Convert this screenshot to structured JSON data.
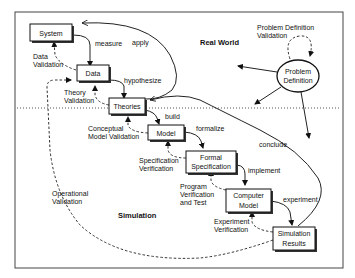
{
  "regions": {
    "real_world": "Real World",
    "simulation": "Simulation"
  },
  "nodes": {
    "system": [
      "System"
    ],
    "data": [
      "Data"
    ],
    "theories": [
      "Theories"
    ],
    "model": [
      "Model"
    ],
    "formal_spec": [
      "Formal",
      "Specification"
    ],
    "computer_model": [
      "Computer",
      "Model"
    ],
    "sim_results": [
      "Simulation",
      "Results"
    ],
    "problem_def": [
      "Problem",
      "Definition"
    ]
  },
  "edges": {
    "measure": "measure",
    "apply": "apply",
    "hypothesize": "hypothesize",
    "build": "build",
    "formalize": "formalize",
    "implement": "implement",
    "experiment": "experiment",
    "conclude": "conclude"
  },
  "validations": {
    "data_validation": [
      "Data",
      "Validation"
    ],
    "theory_validation": [
      "Theory",
      "Validation"
    ],
    "conceptual_model_validation": [
      "Conceptual",
      "Model Validation"
    ],
    "specification_verification": [
      "Specification",
      "Verification"
    ],
    "program_verification": [
      "Program",
      "Verification",
      "and Test"
    ],
    "experiment_verification": [
      "Experiment",
      "Verification"
    ],
    "operational_validation": [
      "Operational",
      "Validation"
    ],
    "problem_definition_validation": [
      "Problem Definition",
      "Validation"
    ]
  },
  "colors": {
    "line": "#222222",
    "background": "#ffffff"
  }
}
